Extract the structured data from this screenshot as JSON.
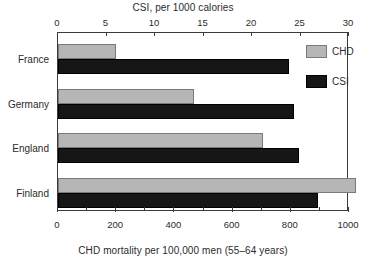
{
  "chart_data": {
    "type": "bar",
    "orientation": "horizontal",
    "title": "",
    "categories": [
      "France",
      "Germany",
      "England",
      "Finland"
    ],
    "series": [
      {
        "name": "CHD",
        "axis": "bottom",
        "color": "#b6b6b6",
        "values": [
          200,
          470,
          710,
          1030
        ]
      },
      {
        "name": "CSI",
        "axis": "top",
        "color": "#161616",
        "values": [
          24.0,
          24.5,
          25.0,
          27.0
        ]
      }
    ],
    "top_axis": {
      "label": "CSI, per 1000 calories",
      "ticks": [
        0,
        5,
        10,
        15,
        20,
        25,
        30
      ],
      "lim": [
        0,
        30
      ]
    },
    "bottom_axis": {
      "label": "CHD mortality per 100,000 men (55–64 years)",
      "ticks": [
        0,
        200,
        400,
        600,
        800,
        1000
      ],
      "minor_ticks": [
        100,
        300,
        500,
        700,
        900
      ],
      "lim": [
        0,
        1000
      ]
    },
    "ylabel": "",
    "grid": false,
    "legend_position": "inside-top-right",
    "legend_entries": [
      "CHD",
      "CSI"
    ]
  }
}
